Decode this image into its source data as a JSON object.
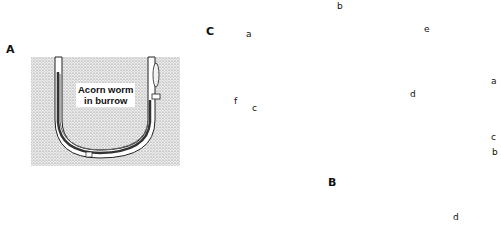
{
  "figure": {
    "panels": [
      {
        "id": "A",
        "label": "A",
        "caption": [
          "Acorn worm",
          "in burrow"
        ]
      },
      {
        "id": "B",
        "label": "B"
      },
      {
        "id": "C",
        "label": "C"
      }
    ],
    "panel_c_labels": [
      "a",
      "b",
      "c",
      "d",
      "e",
      "f"
    ],
    "panel_b_labels": [
      "a",
      "b",
      "c",
      "d"
    ],
    "colors": {
      "line": "#1a1a1a",
      "stipple": "#bdbdbd",
      "background": "#ffffff"
    }
  }
}
